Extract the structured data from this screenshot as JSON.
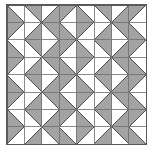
{
  "figure": {
    "type": "geometric-tiling",
    "canvas_width": 155,
    "canvas_height": 156,
    "grid": {
      "rows": 8,
      "cols": 8,
      "origin_x": 7,
      "origin_y": 5,
      "cell_width": 17.4,
      "cell_height": 17.4,
      "border_visible": true
    },
    "colors": {
      "fill_gray": "#a3a3a3",
      "background": "#ffffff",
      "stroke": "#4a4a4a",
      "grid_line": "#7d7d7d",
      "outer_border": "#5a5a5a"
    },
    "stroke_width": 0.9,
    "tile_description": "Each square cell is divided by one diagonal; one of the two triangular halves is filled solid gray and the other is left white.",
    "orientation_legend": [
      {
        "code": "TL",
        "meaning": "diagonal from top-left to bottom-right, lower-left half filled"
      },
      {
        "code": "TR",
        "meaning": "diagonal from top-right to bottom-left, lower-right half filled"
      },
      {
        "code": "BL",
        "meaning": "diagonal from top-right to bottom-left, upper-left half filled"
      },
      {
        "code": "BR",
        "meaning": "diagonal from top-left to bottom-right, upper-right half filled"
      }
    ],
    "cells": [
      [
        "TL",
        "BR",
        "TR",
        "BL",
        "TL",
        "BR",
        "TR",
        "BL"
      ],
      [
        "BL",
        "TR",
        "BR",
        "TL",
        "BL",
        "TR",
        "BR",
        "TL"
      ],
      [
        "TL",
        "BR",
        "TR",
        "BL",
        "TL",
        "BR",
        "TR",
        "BL"
      ],
      [
        "BL",
        "TR",
        "BR",
        "TL",
        "BL",
        "TR",
        "BR",
        "TL"
      ],
      [
        "TL",
        "BR",
        "TR",
        "BL",
        "TL",
        "BR",
        "TR",
        "BL"
      ],
      [
        "BL",
        "TR",
        "BR",
        "TL",
        "BL",
        "TR",
        "BR",
        "TL"
      ],
      [
        "TL",
        "BR",
        "TR",
        "BL",
        "TL",
        "BR",
        "TR",
        "BL"
      ],
      [
        "BL",
        "TR",
        "BR",
        "TL",
        "BL",
        "TR",
        "BR",
        "TL"
      ]
    ]
  }
}
